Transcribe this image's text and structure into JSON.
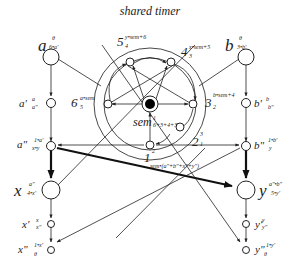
{
  "title": "shared timer",
  "nodes": {
    "a": {
      "label": "a",
      "sup": "θ",
      "sub": "6•a'"
    },
    "b": {
      "label": "b",
      "sup": "θ",
      "sub": "3•b'"
    },
    "a1": {
      "label": "a'",
      "sup": "a",
      "sub": "a\""
    },
    "a2": {
      "label": "a\"",
      "sup": "1•a'",
      "sub": "x•y"
    },
    "b1": {
      "label": "b'",
      "sup": "b",
      "sub": "b\""
    },
    "b2": {
      "label": "b\"",
      "sup": "1•b'",
      "sub": "y"
    },
    "x": {
      "label": "x",
      "sup": "a\"",
      "sub": "4•x'"
    },
    "x1": {
      "label": "x'",
      "sup": "x",
      "sub": "x\""
    },
    "x2": {
      "label": "x\"",
      "sup": "1•x'",
      "sub": "θ"
    },
    "y": {
      "label": "y",
      "sup": "a\"•b\"",
      "sub": "5•y'"
    },
    "y1": {
      "label": "y'",
      "sup": "y",
      "sub": "y\""
    },
    "y2": {
      "label": "y\"",
      "sup": "1•y'",
      "sub": "θ"
    },
    "t1": {
      "label": "1",
      "sup": "2",
      "sub": "sem•(a\"+b\"+x\"+y\")"
    },
    "t2": {
      "label": "2",
      "sup": "3",
      "sub": "1"
    },
    "t3": {
      "label": "3",
      "sup": "b•sem+4",
      "sub": "2"
    },
    "t4": {
      "label": "4",
      "sup": "x•sem+5",
      "sub": "3"
    },
    "t5": {
      "label": "5",
      "sup": "y•sem+6",
      "sub": "4"
    },
    "t6": {
      "label": "6",
      "sup": "a•sem",
      "sub": "5"
    },
    "sem": {
      "label": "sem",
      "sup": "1",
      "sub": "6+3+4+3"
    }
  }
}
